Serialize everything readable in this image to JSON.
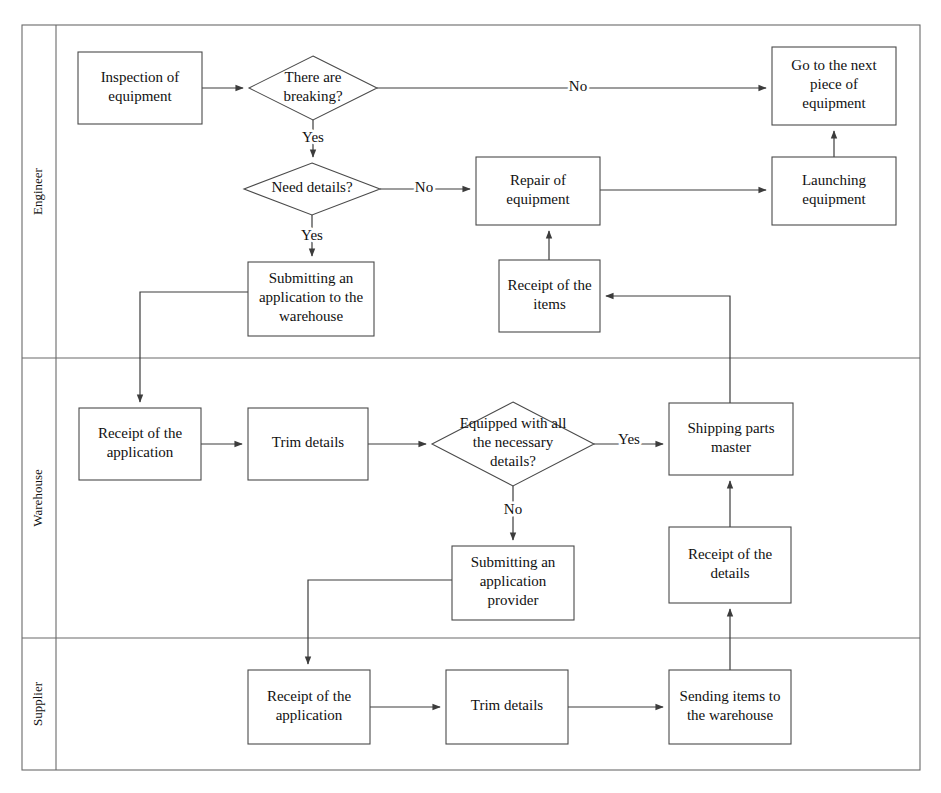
{
  "diagram": {
    "type": "swimlane-flowchart",
    "frame": {
      "x": 22,
      "y": 25,
      "width": 898,
      "height": 745,
      "label_column_width": 34
    },
    "lanes": [
      {
        "id": "engineer",
        "label": "Engineer",
        "y": 25,
        "height": 333
      },
      {
        "id": "warehouse",
        "label": "Warehouse",
        "y": 358,
        "height": 280
      },
      {
        "id": "supplier",
        "label": "Supplier",
        "y": 638,
        "height": 132
      }
    ],
    "nodes": [
      {
        "id": "inspection",
        "lane": "engineer",
        "shape": "rect",
        "x": 78,
        "y": 52,
        "w": 124,
        "h": 72,
        "lines": [
          "Inspection of",
          "equipment"
        ]
      },
      {
        "id": "there-are-breaking",
        "lane": "engineer",
        "shape": "diamond",
        "x": 249,
        "y": 56,
        "w": 128,
        "h": 64,
        "lines": [
          "There are",
          "breaking?"
        ]
      },
      {
        "id": "go-to-next-equipment",
        "lane": "engineer",
        "shape": "rect",
        "x": 772,
        "y": 47,
        "w": 124,
        "h": 78,
        "lines": [
          "Go to the next",
          "piece of",
          "equipment"
        ]
      },
      {
        "id": "need-details",
        "lane": "engineer",
        "shape": "diamond",
        "x": 244,
        "y": 163,
        "w": 136,
        "h": 52,
        "lines": [
          "Need details?"
        ]
      },
      {
        "id": "repair-of-equipment",
        "lane": "engineer",
        "shape": "rect",
        "x": 476,
        "y": 157,
        "w": 124,
        "h": 68,
        "lines": [
          "Repair of",
          "equipment"
        ]
      },
      {
        "id": "launching-equipment",
        "lane": "engineer",
        "shape": "rect",
        "x": 772,
        "y": 157,
        "w": 124,
        "h": 68,
        "lines": [
          "Launching",
          "equipment"
        ]
      },
      {
        "id": "submitting-application-warehouse",
        "lane": "engineer",
        "shape": "rect",
        "x": 248,
        "y": 262,
        "w": 126,
        "h": 74,
        "lines": [
          "Submitting an",
          "application to the",
          "warehouse"
        ]
      },
      {
        "id": "receipt-of-items",
        "lane": "engineer",
        "shape": "rect",
        "x": 499,
        "y": 260,
        "w": 101,
        "h": 72,
        "lines": [
          "Receipt of the",
          "items"
        ]
      },
      {
        "id": "wh-receipt-of-application",
        "lane": "warehouse",
        "shape": "rect",
        "x": 79,
        "y": 408,
        "w": 122,
        "h": 72,
        "lines": [
          "Receipt of the",
          "application"
        ]
      },
      {
        "id": "wh-trim-details",
        "lane": "warehouse",
        "shape": "rect",
        "x": 248,
        "y": 408,
        "w": 120,
        "h": 72,
        "lines": [
          "Trim details"
        ]
      },
      {
        "id": "equipped-with-details",
        "lane": "warehouse",
        "shape": "diamond",
        "x": 432,
        "y": 402,
        "w": 162,
        "h": 84,
        "lines": [
          "Equipped with all",
          "the necessary",
          "details?"
        ]
      },
      {
        "id": "shipping-parts-master",
        "lane": "warehouse",
        "shape": "rect",
        "x": 669,
        "y": 403,
        "w": 124,
        "h": 72,
        "lines": [
          "Shipping parts",
          "master"
        ]
      },
      {
        "id": "submitting-application-provider",
        "lane": "warehouse",
        "shape": "rect",
        "x": 452,
        "y": 546,
        "w": 122,
        "h": 74,
        "lines": [
          "Submitting an",
          "application",
          "provider"
        ]
      },
      {
        "id": "wh-receipt-of-details",
        "lane": "warehouse",
        "shape": "rect",
        "x": 669,
        "y": 527,
        "w": 122,
        "h": 76,
        "lines": [
          "Receipt of the",
          "details"
        ]
      },
      {
        "id": "sp-receipt-of-application",
        "lane": "supplier",
        "shape": "rect",
        "x": 248,
        "y": 670,
        "w": 122,
        "h": 74,
        "lines": [
          "Receipt of the",
          "application"
        ]
      },
      {
        "id": "sp-trim-details",
        "lane": "supplier",
        "shape": "rect",
        "x": 446,
        "y": 670,
        "w": 122,
        "h": 74,
        "lines": [
          "Trim details"
        ]
      },
      {
        "id": "sending-items-to-warehouse",
        "lane": "supplier",
        "shape": "rect",
        "x": 669,
        "y": 670,
        "w": 122,
        "h": 74,
        "lines": [
          "Sending items to",
          "the warehouse"
        ]
      }
    ],
    "edges": [
      {
        "id": "e-inspection-to-breaking",
        "from": "inspection",
        "to": "there-are-breaking",
        "path": "M 202 88 L 243 88",
        "arrow": "end",
        "label": null
      },
      {
        "id": "e-breaking-no-to-next",
        "from": "there-are-breaking",
        "to": "go-to-next-equipment",
        "path": "M 377 88 L 766 88",
        "arrow": "end",
        "label": "No",
        "label_x": 578,
        "label_y": 88
      },
      {
        "id": "e-breaking-yes-to-need-details",
        "from": "there-are-breaking",
        "to": "need-details",
        "path": "M 313 120 L 313 157",
        "arrow": "end",
        "label": "Yes",
        "label_x": 313,
        "label_y": 139
      },
      {
        "id": "e-need-details-no-to-repair",
        "from": "need-details",
        "to": "repair-of-equipment",
        "path": "M 380 189 L 470 189",
        "arrow": "end",
        "label": "No",
        "label_x": 424,
        "label_y": 189
      },
      {
        "id": "e-need-details-yes-to-submitting",
        "from": "need-details",
        "to": "submitting-application-warehouse",
        "path": "M 312 215 L 312 256",
        "arrow": "end",
        "label": "Yes",
        "label_x": 312,
        "label_y": 237
      },
      {
        "id": "e-repair-to-launching",
        "from": "repair-of-equipment",
        "to": "launching-equipment",
        "path": "M 600 190 L 766 190",
        "arrow": "end",
        "label": null
      },
      {
        "id": "e-launching-to-next",
        "from": "launching-equipment",
        "to": "go-to-next-equipment",
        "path": "M 834 157 L 834 131",
        "arrow": "end",
        "label": null
      },
      {
        "id": "e-receipt-items-to-repair",
        "from": "receipt-of-items",
        "to": "repair-of-equipment",
        "path": "M 549 260 L 549 231",
        "arrow": "end",
        "label": null
      },
      {
        "id": "e-submitting-to-wh-receipt",
        "from": "submitting-application-warehouse",
        "to": "wh-receipt-of-application",
        "path": "M 248 292 L 140 292 L 140 402",
        "arrow": "end",
        "label": null
      },
      {
        "id": "e-wh-receipt-to-trim",
        "from": "wh-receipt-of-application",
        "to": "wh-trim-details",
        "path": "M 201 444 L 242 444",
        "arrow": "end",
        "label": null
      },
      {
        "id": "e-wh-trim-to-equipped",
        "from": "wh-trim-details",
        "to": "equipped-with-details",
        "path": "M 368 444 L 426 444",
        "arrow": "end",
        "label": null
      },
      {
        "id": "e-equipped-yes-to-shipping",
        "from": "equipped-with-details",
        "to": "shipping-parts-master",
        "path": "M 594 444 L 663 444",
        "arrow": "end",
        "label": "Yes",
        "label_x": 629,
        "label_y": 441
      },
      {
        "id": "e-equipped-no-to-provider",
        "from": "equipped-with-details",
        "to": "submitting-application-provider",
        "path": "M 513 486 L 513 540",
        "arrow": "end",
        "label": "No",
        "label_x": 513,
        "label_y": 511
      },
      {
        "id": "e-provider-to-sp-receipt",
        "from": "submitting-application-provider",
        "to": "sp-receipt-of-application",
        "path": "M 452 580 L 308 580 L 308 664",
        "arrow": "end",
        "label": null
      },
      {
        "id": "e-sp-receipt-to-sp-trim",
        "from": "sp-receipt-of-application",
        "to": "sp-trim-details",
        "path": "M 370 707 L 440 707",
        "arrow": "end",
        "label": null
      },
      {
        "id": "e-sp-trim-to-sending",
        "from": "sp-trim-details",
        "to": "sending-items-to-warehouse",
        "path": "M 568 707 L 663 707",
        "arrow": "end",
        "label": null
      },
      {
        "id": "e-sending-to-wh-receipt-details",
        "from": "sending-items-to-warehouse",
        "to": "wh-receipt-of-details",
        "path": "M 730 670 L 730 609",
        "arrow": "end",
        "label": null
      },
      {
        "id": "e-wh-receipt-details-to-shipping",
        "from": "wh-receipt-of-details",
        "to": "shipping-parts-master",
        "path": "M 730 527 L 730 481",
        "arrow": "end",
        "label": null
      },
      {
        "id": "e-shipping-to-receipt-items",
        "from": "shipping-parts-master",
        "to": "receipt-of-items",
        "path": "M 793 439 L 730 439 L 730 296 L 606 296",
        "arrow": "end",
        "label": null
      }
    ],
    "colors": {
      "background": "#ffffff",
      "shape_stroke": "#4a4a4a",
      "frame_stroke": "#6a6a6a",
      "connector": "#3c3c3c",
      "text": "#111111"
    }
  }
}
